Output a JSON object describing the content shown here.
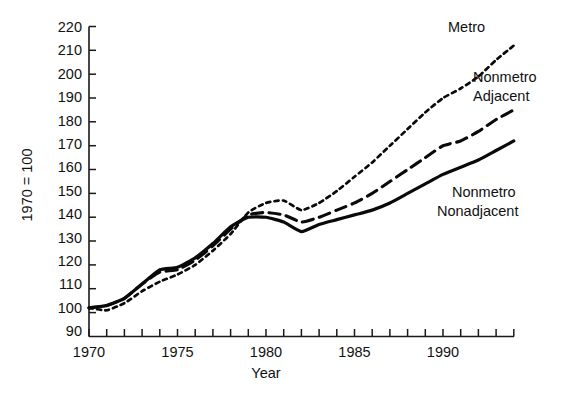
{
  "chart_data": {
    "type": "line",
    "title": "",
    "xlabel": "Year",
    "ylabel": "1970 = 100",
    "xlim": [
      1970,
      1994
    ],
    "ylim": [
      90,
      220
    ],
    "grid": false,
    "legend_position": "inline-right-of-line-ends",
    "x_tick_step": 1,
    "x_labeled_ticks": [
      "1970",
      "1975",
      "1980",
      "1985",
      "1990"
    ],
    "y_ticks": [
      "220",
      "210",
      "200",
      "190",
      "180",
      "170",
      "160",
      "150",
      "140",
      "130",
      "120",
      "110",
      "100",
      "90"
    ],
    "x": [
      1970,
      1971,
      1972,
      1973,
      1974,
      1975,
      1976,
      1977,
      1978,
      1979,
      1980,
      1981,
      1982,
      1983,
      1984,
      1985,
      1986,
      1987,
      1988,
      1989,
      1990,
      1991,
      1992,
      1993,
      1994
    ],
    "series": [
      {
        "name": "Metro",
        "label": "Metro",
        "style": "dotted",
        "values": [
          102,
          101,
          104,
          109,
          113,
          116,
          120,
          126,
          133,
          142,
          146,
          147,
          143,
          146,
          151,
          157,
          163,
          170,
          177,
          184,
          190,
          194,
          199,
          206,
          212
        ]
      },
      {
        "name": "Nonmetro Adjacent",
        "label_line1": "Nonmetro",
        "label_line2": "Adjacent",
        "style": "dashed",
        "values": [
          102,
          103,
          106,
          112,
          117,
          118,
          122,
          128,
          135,
          141,
          142,
          141,
          138,
          140,
          143,
          146,
          150,
          155,
          160,
          165,
          170,
          172,
          176,
          181,
          185
        ]
      },
      {
        "name": "Nonmetro Nonadjacent",
        "label_line1": "Nonmetro",
        "label_line2": "Nonadjacent",
        "style": "solid",
        "values": [
          102,
          103,
          106,
          112,
          118,
          119,
          123,
          129,
          136,
          140,
          140,
          138,
          134,
          137,
          139,
          141,
          143,
          146,
          150,
          154,
          158,
          161,
          164,
          168,
          172
        ]
      }
    ]
  },
  "axis": {
    "y_label": "1970 = 100",
    "x_label": "Year",
    "y_ticks": [
      {
        "value": "220"
      },
      {
        "value": "210"
      },
      {
        "value": "200"
      },
      {
        "value": "190"
      },
      {
        "value": "180"
      },
      {
        "value": "170"
      },
      {
        "value": "160"
      },
      {
        "value": "150"
      },
      {
        "value": "140"
      },
      {
        "value": "130"
      },
      {
        "value": "120"
      },
      {
        "value": "110"
      },
      {
        "value": "100"
      },
      {
        "value": "90"
      }
    ],
    "x_ticks": [
      {
        "value": "1970"
      },
      {
        "value": "1975"
      },
      {
        "value": "1980"
      },
      {
        "value": "1985"
      },
      {
        "value": "1990"
      }
    ]
  },
  "annotations": {
    "metro": "Metro",
    "nonmetro_adjacent_line1": "Nonmetro",
    "nonmetro_adjacent_line2": "Adjacent",
    "nonmetro_nonadjacent_line1": "Nonmetro",
    "nonmetro_nonadjacent_line2": "Nonadjacent"
  },
  "colors": {
    "ink": "#0a0a0a",
    "background": "#ffffff"
  }
}
